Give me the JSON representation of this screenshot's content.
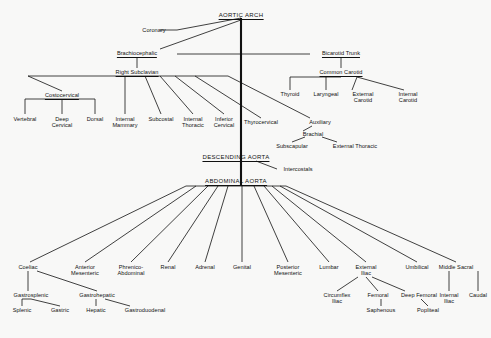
{
  "diagram": {
    "background_color": "#f8f8f7",
    "line_color": "#111111",
    "nodes": [
      {
        "id": "aortic_arch",
        "label": "AORTIC ARCH",
        "x": 241,
        "y": 16,
        "style": "major",
        "anchor": "center"
      },
      {
        "id": "coronary",
        "label": "Coronary",
        "x": 154,
        "y": 31,
        "style": "plain"
      },
      {
        "id": "brachiocephalic",
        "label": "Brachiocephalic",
        "x": 137,
        "y": 54,
        "style": "named"
      },
      {
        "id": "bicarotid_trunk",
        "label": "Bicarotid Trunk",
        "x": 341,
        "y": 54,
        "style": "named"
      },
      {
        "id": "right_subclavian",
        "label": "Right Subclavian",
        "x": 137,
        "y": 73,
        "style": "named"
      },
      {
        "id": "common_carotid",
        "label": "Common Carotid",
        "x": 341,
        "y": 73,
        "style": "named"
      },
      {
        "id": "costocervical",
        "label": "Costocervical",
        "x": 62,
        "y": 96,
        "style": "named"
      },
      {
        "id": "thyroid",
        "label": "Thyroid",
        "x": 290,
        "y": 95,
        "style": "plain"
      },
      {
        "id": "laryngeal",
        "label": "Laryngeal",
        "x": 326,
        "y": 95,
        "style": "plain"
      },
      {
        "id": "external_carotid",
        "label": "External\nCarotid",
        "x": 363,
        "y": 95,
        "style": "plain"
      },
      {
        "id": "internal_carotid",
        "label": "Internal\nCarotid",
        "x": 408,
        "y": 95,
        "style": "plain"
      },
      {
        "id": "vertebral",
        "label": "Vertebral",
        "x": 25,
        "y": 120,
        "style": "plain"
      },
      {
        "id": "deep_cervical",
        "label": "Deep\nCervical",
        "x": 62,
        "y": 120,
        "style": "plain"
      },
      {
        "id": "dorsal",
        "label": "Dorsal",
        "x": 95,
        "y": 120,
        "style": "plain"
      },
      {
        "id": "internal_mammary",
        "label": "Internal\nMammary",
        "x": 125,
        "y": 120,
        "style": "plain"
      },
      {
        "id": "subcostal",
        "label": "Subcostal",
        "x": 161,
        "y": 120,
        "style": "plain"
      },
      {
        "id": "internal_thoracic",
        "label": "Internal\nThoracic",
        "x": 193,
        "y": 120,
        "style": "plain"
      },
      {
        "id": "inferior_cervical",
        "label": "Inferior\nCervical",
        "x": 224,
        "y": 120,
        "style": "plain"
      },
      {
        "id": "thyrocervical",
        "label": "Thyrocervical",
        "x": 261,
        "y": 123,
        "style": "plain"
      },
      {
        "id": "auxiliary",
        "label": "Auxiliary",
        "x": 320,
        "y": 123,
        "style": "plain"
      },
      {
        "id": "brachial",
        "label": "Brachial",
        "x": 313,
        "y": 135,
        "style": "plain"
      },
      {
        "id": "subscapular",
        "label": "Subscapular",
        "x": 292,
        "y": 147,
        "style": "plain"
      },
      {
        "id": "external_thoracic",
        "label": "External Thoracic",
        "x": 355,
        "y": 147,
        "style": "plain"
      },
      {
        "id": "descending_aorta",
        "label": "DESCENDING AORTA",
        "x": 236,
        "y": 158,
        "style": "major"
      },
      {
        "id": "intercostals",
        "label": "Intercostals",
        "x": 298,
        "y": 170,
        "style": "plain"
      },
      {
        "id": "abdominal_aorta",
        "label": "ABDOMINAL AORTA",
        "x": 236,
        "y": 182,
        "style": "major"
      },
      {
        "id": "coeliac",
        "label": "Coeliac",
        "x": 28,
        "y": 268,
        "style": "plain"
      },
      {
        "id": "anterior_mesenteric",
        "label": "Anterior\nMesenteric",
        "x": 85,
        "y": 268,
        "style": "plain"
      },
      {
        "id": "phrenico_abdominal",
        "label": "Phrenico-\nAbdominal",
        "x": 131,
        "y": 268,
        "style": "plain"
      },
      {
        "id": "renal",
        "label": "Renal",
        "x": 168,
        "y": 268,
        "style": "plain"
      },
      {
        "id": "adrenal",
        "label": "Adrenal",
        "x": 205,
        "y": 268,
        "style": "plain"
      },
      {
        "id": "genital",
        "label": "Genital",
        "x": 242,
        "y": 268,
        "style": "plain"
      },
      {
        "id": "posterior_mesenteric",
        "label": "Posterior\nMesenteric",
        "x": 288,
        "y": 268,
        "style": "plain"
      },
      {
        "id": "lumbar",
        "label": "Lumbar",
        "x": 329,
        "y": 268,
        "style": "plain"
      },
      {
        "id": "external_iliac",
        "label": "External\nIliac",
        "x": 366,
        "y": 268,
        "style": "plain"
      },
      {
        "id": "umbilical",
        "label": "Umbilical",
        "x": 417,
        "y": 268,
        "style": "plain"
      },
      {
        "id": "middle_sacral",
        "label": "Middle Sacral",
        "x": 456,
        "y": 268,
        "style": "plain"
      },
      {
        "id": "gastrosplenic",
        "label": "Gastrosplenic",
        "x": 31,
        "y": 296,
        "style": "plain"
      },
      {
        "id": "gastrohepatic",
        "label": "Gastrohepatic",
        "x": 97,
        "y": 296,
        "style": "plain"
      },
      {
        "id": "circumflex_iliac",
        "label": "Circumflex\nIliac",
        "x": 337,
        "y": 296,
        "style": "plain"
      },
      {
        "id": "femoral",
        "label": "Femoral",
        "x": 378,
        "y": 296,
        "style": "plain"
      },
      {
        "id": "deep_femoral",
        "label": "Deep Femoral",
        "x": 419,
        "y": 296,
        "style": "plain"
      },
      {
        "id": "internal_iliac",
        "label": "Internal\nIliac",
        "x": 449,
        "y": 296,
        "style": "plain"
      },
      {
        "id": "caudal",
        "label": "Caudal",
        "x": 478,
        "y": 296,
        "style": "plain"
      },
      {
        "id": "splenic",
        "label": "Splenic",
        "x": 22,
        "y": 311,
        "style": "plain"
      },
      {
        "id": "gastric",
        "label": "Gastric",
        "x": 60,
        "y": 311,
        "style": "plain"
      },
      {
        "id": "hepatic",
        "label": "Hepatic",
        "x": 96,
        "y": 311,
        "style": "plain"
      },
      {
        "id": "gastroduodenal",
        "label": "Gastroduodenal",
        "x": 145,
        "y": 311,
        "style": "plain"
      },
      {
        "id": "saphenous",
        "label": "Saphenous",
        "x": 381,
        "y": 311,
        "style": "plain"
      },
      {
        "id": "popliteal",
        "label": "Popliteal",
        "x": 428,
        "y": 311,
        "style": "plain"
      }
    ],
    "edges": [
      {
        "from": "aortic_arch",
        "to": "coronary",
        "x1": 241,
        "y1": 18,
        "x2": 177,
        "y2": 30
      },
      {
        "from": "coronary-line",
        "to": "coronary",
        "x1": 177,
        "y1": 30,
        "x2": 160,
        "y2": 30
      },
      {
        "from": "aortic_arch",
        "to": "brachiocephalic",
        "x1": 241,
        "y1": 20,
        "x2": 160,
        "y2": 49
      },
      {
        "from": "trunk-vertical",
        "to": "descending",
        "x1": 241,
        "y1": 18,
        "x2": 241,
        "y2": 186
      },
      {
        "from": "arch-horizontal",
        "to": "bicarotid",
        "x1": 177,
        "y1": 54,
        "x2": 310,
        "y2": 54
      },
      {
        "from": "brachiocephalic",
        "to": "right_subclavian",
        "x1": 137,
        "y1": 57,
        "x2": 137,
        "y2": 68
      },
      {
        "from": "bicarotid_trunk",
        "to": "common_carotid",
        "x1": 341,
        "y1": 57,
        "x2": 341,
        "y2": 68
      },
      {
        "from": "right_subclavian-bar",
        "to": "fan",
        "x1": 28,
        "y1": 76,
        "x2": 228,
        "y2": 76
      },
      {
        "from": "right_subclavian",
        "to": "costocervical",
        "x1": 28,
        "y1": 76,
        "x2": 62,
        "y2": 91
      },
      {
        "from": "costocervical-bar",
        "to": "children",
        "x1": 25,
        "y1": 99,
        "x2": 95,
        "y2": 99
      },
      {
        "from": "costocervical",
        "to": "vertebral",
        "x1": 25,
        "y1": 99,
        "x2": 25,
        "y2": 114
      },
      {
        "from": "costocervical",
        "to": "deep_cervical",
        "x1": 62,
        "y1": 99,
        "x2": 62,
        "y2": 114
      },
      {
        "from": "costocervical",
        "to": "dorsal",
        "x1": 95,
        "y1": 99,
        "x2": 95,
        "y2": 114
      },
      {
        "from": "right_subclavian",
        "to": "internal_mammary",
        "x1": 125,
        "y1": 76,
        "x2": 125,
        "y2": 114
      },
      {
        "from": "right_subclavian",
        "to": "subcostal",
        "x1": 145,
        "y1": 76,
        "x2": 161,
        "y2": 114
      },
      {
        "from": "right_subclavian",
        "to": "internal_thoracic",
        "x1": 160,
        "y1": 76,
        "x2": 193,
        "y2": 114
      },
      {
        "from": "right_subclavian",
        "to": "inferior_cervical",
        "x1": 175,
        "y1": 76,
        "x2": 224,
        "y2": 114
      },
      {
        "from": "right_subclavian",
        "to": "thyrocervical",
        "x1": 195,
        "y1": 76,
        "x2": 261,
        "y2": 118
      },
      {
        "from": "right_subclavian",
        "to": "auxiliary",
        "x1": 228,
        "y1": 76,
        "x2": 310,
        "y2": 118
      },
      {
        "from": "auxiliary",
        "to": "brachial",
        "x1": 312,
        "y1": 126,
        "x2": 303,
        "y2": 131
      },
      {
        "from": "brachial",
        "to": "subscapular",
        "x1": 305,
        "y1": 137,
        "x2": 292,
        "y2": 142
      },
      {
        "from": "brachial",
        "to": "external_thoracic",
        "x1": 322,
        "y1": 137,
        "x2": 337,
        "y2": 142
      },
      {
        "from": "common_carotid-bar",
        "to": "children",
        "x1": 290,
        "y1": 77,
        "x2": 341,
        "y2": 77
      },
      {
        "from": "common_carotid",
        "to": "thyroid",
        "x1": 290,
        "y1": 77,
        "x2": 290,
        "y2": 90
      },
      {
        "from": "common_carotid",
        "to": "laryngeal",
        "x1": 326,
        "y1": 77,
        "x2": 326,
        "y2": 90
      },
      {
        "from": "common_carotid",
        "to": "external_carotid",
        "x1": 357,
        "y1": 77,
        "x2": 352,
        "y2": 90
      },
      {
        "from": "common_carotid",
        "to": "internal_carotid",
        "x1": 357,
        "y1": 77,
        "x2": 404,
        "y2": 90
      },
      {
        "from": "descending_aorta",
        "to": "intercostals",
        "x1": 256,
        "y1": 161,
        "x2": 277,
        "y2": 169
      },
      {
        "from": "abdominal-bar",
        "to": "fan",
        "x1": 186,
        "y1": 186,
        "x2": 286,
        "y2": 186
      },
      {
        "from": "abdominal_aorta",
        "to": "coeliac",
        "x1": 186,
        "y1": 186,
        "x2": 30,
        "y2": 262
      },
      {
        "from": "abdominal_aorta",
        "to": "anterior_mesenteric",
        "x1": 196,
        "y1": 186,
        "x2": 85,
        "y2": 262
      },
      {
        "from": "abdominal_aorta",
        "to": "phrenico_abdominal",
        "x1": 208,
        "y1": 186,
        "x2": 131,
        "y2": 262
      },
      {
        "from": "abdominal_aorta",
        "to": "renal",
        "x1": 218,
        "y1": 186,
        "x2": 168,
        "y2": 262
      },
      {
        "from": "abdominal_aorta",
        "to": "adrenal",
        "x1": 228,
        "y1": 186,
        "x2": 205,
        "y2": 262
      },
      {
        "from": "abdominal_aorta",
        "to": "genital",
        "x1": 242,
        "y1": 186,
        "x2": 242,
        "y2": 262
      },
      {
        "from": "abdominal_aorta",
        "to": "posterior_mesenteric",
        "x1": 254,
        "y1": 186,
        "x2": 288,
        "y2": 262
      },
      {
        "from": "abdominal_aorta",
        "to": "lumbar",
        "x1": 264,
        "y1": 186,
        "x2": 329,
        "y2": 262
      },
      {
        "from": "abdominal_aorta",
        "to": "external_iliac",
        "x1": 272,
        "y1": 186,
        "x2": 366,
        "y2": 262
      },
      {
        "from": "abdominal_aorta",
        "to": "umbilical",
        "x1": 280,
        "y1": 186,
        "x2": 417,
        "y2": 262
      },
      {
        "from": "abdominal_aorta",
        "to": "middle_sacral",
        "x1": 286,
        "y1": 186,
        "x2": 456,
        "y2": 262
      },
      {
        "from": "coeliac",
        "to": "gastrosplenic",
        "x1": 28,
        "y1": 271,
        "x2": 28,
        "y2": 291
      },
      {
        "from": "coeliac",
        "to": "gastrohepatic",
        "x1": 37,
        "y1": 271,
        "x2": 97,
        "y2": 291
      },
      {
        "from": "gastrosplenic-bar",
        "to": "children",
        "x1": 22,
        "y1": 299,
        "x2": 31,
        "y2": 299
      },
      {
        "from": "gastrosplenic",
        "to": "splenic",
        "x1": 22,
        "y1": 299,
        "x2": 22,
        "y2": 306
      },
      {
        "from": "gastrosplenic",
        "to": "gastric",
        "x1": 31,
        "y1": 299,
        "x2": 60,
        "y2": 306
      },
      {
        "from": "gastrohepatic",
        "to": "hepatic",
        "x1": 96,
        "y1": 299,
        "x2": 96,
        "y2": 306
      },
      {
        "from": "gastrohepatic",
        "to": "gastroduodenal",
        "x1": 105,
        "y1": 299,
        "x2": 130,
        "y2": 306
      },
      {
        "from": "external_iliac",
        "to": "circumflex_iliac",
        "x1": 358,
        "y1": 277,
        "x2": 337,
        "y2": 291
      },
      {
        "from": "external_iliac",
        "to": "femoral",
        "x1": 366,
        "y1": 277,
        "x2": 378,
        "y2": 291
      },
      {
        "from": "external_iliac",
        "to": "deep_femoral",
        "x1": 372,
        "y1": 277,
        "x2": 405,
        "y2": 291
      },
      {
        "from": "femoral",
        "to": "saphenous",
        "x1": 381,
        "y1": 299,
        "x2": 381,
        "y2": 306
      },
      {
        "from": "deep_femoral",
        "to": "popliteal",
        "x1": 421,
        "y1": 299,
        "x2": 428,
        "y2": 306
      },
      {
        "from": "umbilical",
        "to": "internal_iliac",
        "x1": 449,
        "y1": 271,
        "x2": 449,
        "y2": 291
      },
      {
        "from": "middle_sacral",
        "to": "caudal",
        "x1": 478,
        "y1": 271,
        "x2": 478,
        "y2": 291
      }
    ]
  }
}
